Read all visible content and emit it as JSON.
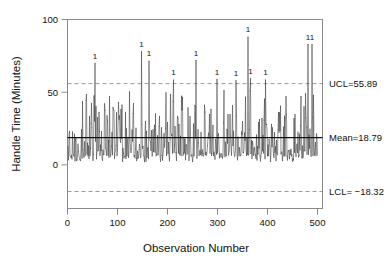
{
  "chart_data": {
    "type": "line",
    "title": "",
    "xlabel": "Observation Number",
    "ylabel": "Handle Time (Minutes)",
    "xlim": [
      0,
      510
    ],
    "ylim": [
      -30,
      100
    ],
    "xticks": [
      0,
      100,
      200,
      300,
      400,
      500
    ],
    "xtick_labels": [
      "0",
      "100",
      "200",
      "300",
      "400",
      "500"
    ],
    "yticks": [
      0,
      50,
      100
    ],
    "ytick_labels": [
      "0",
      "50",
      "100"
    ],
    "grid": false,
    "legend": "none",
    "n_observations": 500,
    "series_name": "Handle Time",
    "series_color": "#3a3a3a",
    "control_limits": {
      "ucl": 55.89,
      "center": 18.79,
      "lcl": -18.32,
      "ucl_label": "UCL=55.89",
      "center_label": "Mean=18.79",
      "lcl_label": "LCL= −18.32",
      "ucl_color": "#8d8d8d",
      "center_color": "#111111",
      "lcl_color": "#8d8d8d"
    },
    "violation_marker": "1",
    "violations": [
      {
        "x": 55,
        "y": 70.0,
        "label": "1"
      },
      {
        "x": 148,
        "y": 78.0,
        "label": "1"
      },
      {
        "x": 163,
        "y": 71.5,
        "label": "1"
      },
      {
        "x": 212,
        "y": 58.5,
        "label": "1"
      },
      {
        "x": 257,
        "y": 72.0,
        "label": "1"
      },
      {
        "x": 299,
        "y": 59.0,
        "label": "1"
      },
      {
        "x": 337,
        "y": 58.0,
        "label": "1"
      },
      {
        "x": 361,
        "y": 88.0,
        "label": "1"
      },
      {
        "x": 366,
        "y": 59.5,
        "label": "1"
      },
      {
        "x": 396,
        "y": 58.5,
        "label": "1"
      },
      {
        "x": 481,
        "y": 83.0,
        "label": "1"
      },
      {
        "x": 489,
        "y": 83.0,
        "label": "1"
      }
    ],
    "series_stats": {
      "floor": 2.0,
      "typical_low": 6.0,
      "typical_high": 34.0,
      "bulk_max": 52.0,
      "noise_seed": 20240517
    }
  }
}
